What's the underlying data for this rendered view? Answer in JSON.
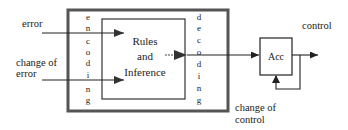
{
  "diagram": {
    "inputs": {
      "error": "error",
      "change_of_error_line1": "change of",
      "change_of_error_line2": "error"
    },
    "encoding_letters": [
      "e",
      "n",
      "c",
      "o",
      "d",
      "i",
      "n",
      "g"
    ],
    "decoding_letters": [
      "d",
      "e",
      "c",
      "o",
      "d",
      "i",
      "n",
      "g"
    ],
    "inference_block": {
      "line1": "Rules",
      "line2": "and",
      "line3": "Inference"
    },
    "accumulator": {
      "label": "Acc"
    },
    "outputs": {
      "control": "control",
      "change_of_control_line1": "change of",
      "change_of_control_line2": "control"
    },
    "colors": {
      "outer_border": "#555555",
      "line": "#222222"
    }
  }
}
